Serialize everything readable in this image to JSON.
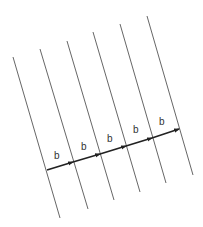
{
  "diagram": {
    "colors": {
      "line": "#555555",
      "arrow": "#222222",
      "label": "#333333",
      "background": "#ffffff"
    },
    "parallel_lines": [
      {
        "x1": 13,
        "y1": 57,
        "x2": 60,
        "y2": 218
      },
      {
        "x1": 40,
        "y1": 49,
        "x2": 88,
        "y2": 209
      },
      {
        "x1": 67,
        "y1": 41,
        "x2": 114,
        "y2": 200
      },
      {
        "x1": 93,
        "y1": 32,
        "x2": 140,
        "y2": 192
      },
      {
        "x1": 120,
        "y1": 24,
        "x2": 166,
        "y2": 183
      },
      {
        "x1": 147,
        "y1": 16,
        "x2": 193,
        "y2": 175
      }
    ],
    "arrows": [
      {
        "x1": 47,
        "y1": 170,
        "x2": 73,
        "y2": 162,
        "label": "b",
        "lx": 54,
        "ly": 159
      },
      {
        "x1": 73,
        "y1": 162,
        "x2": 100,
        "y2": 154,
        "label": "b",
        "lx": 81,
        "ly": 150
      },
      {
        "x1": 100,
        "y1": 154,
        "x2": 126,
        "y2": 146,
        "label": "b",
        "lx": 107,
        "ly": 142
      },
      {
        "x1": 126,
        "y1": 146,
        "x2": 152,
        "y2": 138,
        "label": "b",
        "lx": 133,
        "ly": 133
      },
      {
        "x1": 152,
        "y1": 138,
        "x2": 179,
        "y2": 129,
        "label": "b",
        "lx": 159,
        "ly": 125
      }
    ]
  }
}
